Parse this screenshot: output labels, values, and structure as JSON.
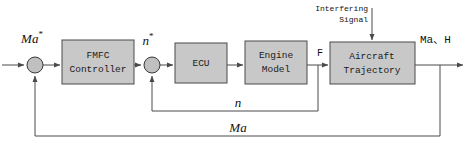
{
  "diagram": {
    "colors": {
      "block_fill": "#c8c8c8",
      "block_stroke": "#4a4a4a",
      "sum_fill": "#c0c0c0",
      "wire": "#4a4a4a",
      "text": "#111111",
      "background": "#ffffff"
    },
    "blocks": [
      {
        "id": "fmfc",
        "label_line1": "FMFC",
        "label_line2": "Controller",
        "x": 62,
        "y": 40,
        "w": 72,
        "h": 44
      },
      {
        "id": "ecu",
        "label_line1": "ECU",
        "label_line2": "",
        "x": 175,
        "y": 43,
        "w": 52,
        "h": 40
      },
      {
        "id": "engine",
        "label_line1": "Engine",
        "label_line2": "Model",
        "x": 245,
        "y": 41,
        "w": 62,
        "h": 43
      },
      {
        "id": "aircraft",
        "label_line1": "Aircraft",
        "label_line2": "Trajectory",
        "x": 330,
        "y": 42,
        "w": 85,
        "h": 42
      }
    ],
    "summing_junctions": [
      {
        "id": "sum-outer",
        "cx": 35,
        "cy": 65,
        "r": 8
      },
      {
        "id": "sum-inner",
        "cx": 152,
        "cy": 65,
        "r": 8
      }
    ],
    "signals": {
      "reference_input": "Ma",
      "reference_input_star": "*",
      "inner_reference": "n",
      "inner_reference_star": "*",
      "thrust": "F",
      "output": "Ma、H",
      "inner_feedback": "n",
      "outer_feedback": "Ma",
      "disturbance_line1": "Interfering",
      "disturbance_line2": "Signal"
    },
    "loops": {
      "inner_loop_y": 111,
      "outer_loop_y": 136,
      "inner_tap_x": 318,
      "outer_tap_x": 440
    }
  }
}
